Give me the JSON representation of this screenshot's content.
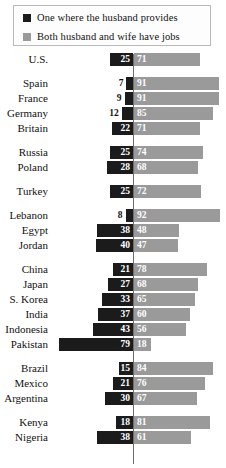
{
  "legend": {
    "items": [
      {
        "label": "One where the husband provides",
        "swatch_name": "legend-swatch-husband-provides",
        "color": "#1b1b1b"
      },
      {
        "label": "Both husband and wife have jobs",
        "swatch_name": "legend-swatch-both-jobs",
        "color": "#9a9a9a"
      }
    ]
  },
  "chart_data": {
    "type": "bar",
    "title": "",
    "subtitle": "",
    "xlabel": "",
    "ylabel": "",
    "orientation": "horizontal-diverging",
    "axis_center": 0,
    "xlim": [
      0,
      100
    ],
    "grid": false,
    "legend_position": "top",
    "categories": [
      "U.S.",
      "Spain",
      "France",
      "Germany",
      "Britain",
      "Russia",
      "Poland",
      "Turkey",
      "Lebanon",
      "Egypt",
      "Jordan",
      "China",
      "Japan",
      "S. Korea",
      "India",
      "Indonesia",
      "Pakistan",
      "Brazil",
      "Mexico",
      "Argentina",
      "Kenya",
      "Nigeria"
    ],
    "series": [
      {
        "name": "One where the husband provides",
        "direction": "left",
        "color": "#1b1b1b",
        "values": [
          25,
          7,
          9,
          12,
          22,
          25,
          28,
          25,
          8,
          38,
          40,
          21,
          27,
          33,
          37,
          43,
          79,
          15,
          21,
          30,
          18,
          38
        ]
      },
      {
        "name": "Both husband and wife have jobs",
        "direction": "right",
        "color": "#9a9a9a",
        "values": [
          71,
          91,
          91,
          85,
          71,
          74,
          68,
          72,
          92,
          48,
          47,
          78,
          68,
          65,
          60,
          56,
          18,
          84,
          76,
          67,
          81,
          61
        ]
      }
    ],
    "groups": [
      {
        "name": "north-america",
        "rows": [
          {
            "country": "U.S.",
            "husband": 25,
            "both": 71
          }
        ]
      },
      {
        "name": "western-europe",
        "rows": [
          {
            "country": "Spain",
            "husband": 7,
            "both": 91
          },
          {
            "country": "France",
            "husband": 9,
            "both": 91
          },
          {
            "country": "Germany",
            "husband": 12,
            "both": 85
          },
          {
            "country": "Britain",
            "husband": 22,
            "both": 71
          }
        ]
      },
      {
        "name": "eastern-europe",
        "rows": [
          {
            "country": "Russia",
            "husband": 25,
            "both": 74
          },
          {
            "country": "Poland",
            "husband": 28,
            "both": 68
          }
        ]
      },
      {
        "name": "turkey",
        "rows": [
          {
            "country": "Turkey",
            "husband": 25,
            "both": 72
          }
        ]
      },
      {
        "name": "middle-east",
        "rows": [
          {
            "country": "Lebanon",
            "husband": 8,
            "both": 92
          },
          {
            "country": "Egypt",
            "husband": 38,
            "both": 48
          },
          {
            "country": "Jordan",
            "husband": 40,
            "both": 47
          }
        ]
      },
      {
        "name": "asia",
        "rows": [
          {
            "country": "China",
            "husband": 21,
            "both": 78
          },
          {
            "country": "Japan",
            "husband": 27,
            "both": 68
          },
          {
            "country": "S. Korea",
            "husband": 33,
            "both": 65
          },
          {
            "country": "India",
            "husband": 37,
            "both": 60
          },
          {
            "country": "Indonesia",
            "husband": 43,
            "both": 56
          },
          {
            "country": "Pakistan",
            "husband": 79,
            "both": 18
          }
        ]
      },
      {
        "name": "latin-america",
        "rows": [
          {
            "country": "Brazil",
            "husband": 15,
            "both": 84
          },
          {
            "country": "Mexico",
            "husband": 21,
            "both": 76
          },
          {
            "country": "Argentina",
            "husband": 30,
            "both": 67
          }
        ]
      },
      {
        "name": "africa",
        "rows": [
          {
            "country": "Kenya",
            "husband": 18,
            "both": 81
          },
          {
            "country": "Nigeria",
            "husband": 38,
            "both": 61
          }
        ]
      }
    ]
  }
}
